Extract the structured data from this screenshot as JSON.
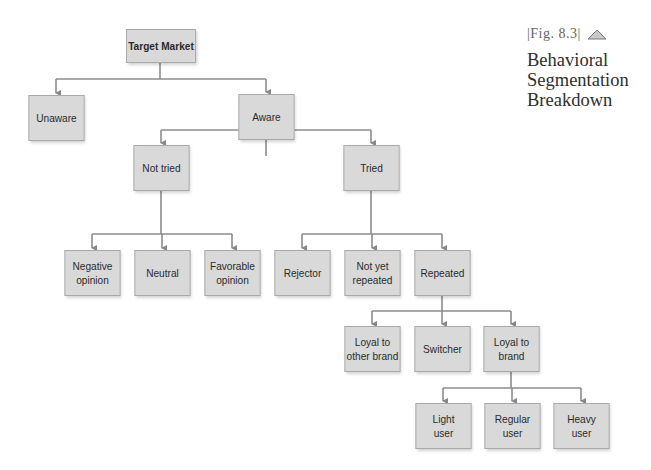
{
  "figure": {
    "label": "|Fig. 8.3|",
    "title": "Behavioral\nSegmentation\nBreakdown",
    "icon": "triangle-icon"
  },
  "colors": {
    "box_fill": "#d9d9d9",
    "box_border": "#a9a9a9",
    "connector": "#888888",
    "text": "#2b2b2b"
  },
  "nodes": {
    "target_market": "Target Market",
    "unaware": "Unaware",
    "aware": "Aware",
    "not_tried": "Not tried",
    "tried": "Tried",
    "negative_opinion": "Negative\nopinion",
    "neutral": "Neutral",
    "favorable_opinion": "Favorable\nopinion",
    "rejector": "Rejector",
    "not_yet_repeated": "Not yet\nrepeated",
    "repeated": "Repeated",
    "loyal_other_brand": "Loyal to\nother brand",
    "switcher": "Switcher",
    "loyal_brand": "Loyal to\nbrand",
    "light_user": "Light\nuser",
    "regular_user": "Regular\nuser",
    "heavy_user": "Heavy\nuser"
  },
  "tree": {
    "Target Market": [
      "Unaware",
      "Aware"
    ],
    "Aware": [
      "Not tried",
      "Tried"
    ],
    "Not tried": [
      "Negative opinion",
      "Neutral",
      "Favorable opinion"
    ],
    "Tried": [
      "Rejector",
      "Not yet repeated",
      "Repeated"
    ],
    "Repeated": [
      "Loyal to other brand",
      "Switcher",
      "Loyal to brand"
    ],
    "Loyal to brand": [
      "Light user",
      "Regular user",
      "Heavy user"
    ]
  }
}
